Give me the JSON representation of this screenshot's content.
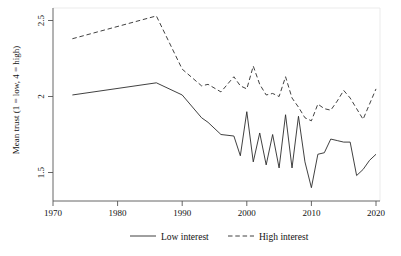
{
  "chart_data": {
    "type": "line",
    "title": "",
    "xlabel": "",
    "ylabel": "Mean trust (1 = low, 4 = high)",
    "xlim": [
      1970,
      2021
    ],
    "ylim": [
      1.37,
      2.56
    ],
    "xticks": [
      1970,
      1980,
      1990,
      2000,
      2010,
      2020
    ],
    "xtick_labels": [
      "1970",
      "1980",
      "1990",
      "2000",
      "2010",
      "2020"
    ],
    "yticks": [
      1.5,
      2,
      2.5
    ],
    "ytick_labels": [
      "1.5",
      "2",
      "2.5"
    ],
    "grid": false,
    "legend_position": "below-axes",
    "line_color": "#2b2b2b",
    "series": [
      {
        "name": "Low interest",
        "style": "solid",
        "x": [
          1973,
          1986,
          1990,
          1993,
          1994,
          1996,
          1998,
          1999,
          2000,
          2001,
          2002,
          2003,
          2004,
          2005,
          2006,
          2007,
          2008,
          2009,
          2010,
          2011,
          2012,
          2013,
          2014,
          2015,
          2016,
          2017,
          2018,
          2019,
          2020
        ],
        "values": [
          2.01,
          2.09,
          2.01,
          1.86,
          1.83,
          1.75,
          1.74,
          1.61,
          1.9,
          1.57,
          1.76,
          1.55,
          1.75,
          1.53,
          1.88,
          1.53,
          1.87,
          1.57,
          1.4,
          1.62,
          1.63,
          1.72,
          1.71,
          1.7,
          1.7,
          1.48,
          1.52,
          1.58,
          1.62
        ]
      },
      {
        "name": "High interest",
        "style": "dashed",
        "x": [
          1973,
          1986,
          1990,
          1993,
          1994,
          1996,
          1998,
          1999,
          2000,
          2001,
          2002,
          2003,
          2004,
          2005,
          2006,
          2007,
          2008,
          2009,
          2010,
          2011,
          2012,
          2013,
          2014,
          2015,
          2016,
          2017,
          2018,
          2019,
          2020
        ],
        "values": [
          2.38,
          2.53,
          2.18,
          2.07,
          2.08,
          2.03,
          2.13,
          2.07,
          2.05,
          2.2,
          2.08,
          2.01,
          2.02,
          2.0,
          2.13,
          1.99,
          1.93,
          1.86,
          1.84,
          1.95,
          1.92,
          1.91,
          1.97,
          2.04,
          1.99,
          1.92,
          1.85,
          1.95,
          2.05
        ]
      }
    ],
    "legend": [
      {
        "label": "Low interest",
        "style": "solid"
      },
      {
        "label": "High interest",
        "style": "dashed"
      }
    ]
  },
  "axis": {
    "y_label": "Mean trust (1 = low, 4 = high)",
    "y_tick_0": "1.5",
    "y_tick_1": "2",
    "y_tick_2": "2.5",
    "x_tick_0": "1970",
    "x_tick_1": "1980",
    "x_tick_2": "1990",
    "x_tick_3": "2000",
    "x_tick_4": "2010",
    "x_tick_5": "2020"
  },
  "legend": {
    "item_0_label": "Low interest",
    "item_1_label": "High interest"
  }
}
